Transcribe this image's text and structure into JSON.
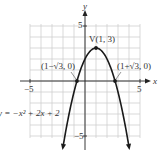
{
  "chart_data": {
    "type": "line",
    "title": "",
    "equation": "y = −x² + 2x + 2",
    "xlabel": "x",
    "ylabel": "y",
    "xlim": [
      -5,
      5
    ],
    "ylim": [
      -5,
      5
    ],
    "grid": true,
    "tick_labels": {
      "x": [
        "−5",
        "5"
      ],
      "y": [
        "5",
        "−5"
      ]
    },
    "series": [
      {
        "name": "y = −x² + 2x + 2",
        "function": "-x^2 + 2x + 2",
        "x_range": [
          -2,
          4
        ],
        "arrows_at_ends": true
      }
    ],
    "points": [
      {
        "label": "V(1, 3)",
        "x": 1,
        "y": 3
      },
      {
        "label": "(1−√3, 0)",
        "x": -0.732,
        "y": 0
      },
      {
        "label": "(1+√3, 0)",
        "x": 2.732,
        "y": 0
      }
    ]
  },
  "labels": {
    "x_axis": "x",
    "y_axis": "y",
    "x_neg5": "−5",
    "x_pos5": "5",
    "y_pos5": "5",
    "y_neg5": "−5",
    "vertex": "V(1, 3)",
    "left_root": "(1−√3, 0)",
    "right_root": "(1+√3, 0)",
    "equation": "y = −x² + 2x + 2"
  },
  "colors": {
    "grid": "#cfcfcf",
    "axis": "#222222",
    "curve": "#1a1a1a",
    "text": "#333333"
  }
}
